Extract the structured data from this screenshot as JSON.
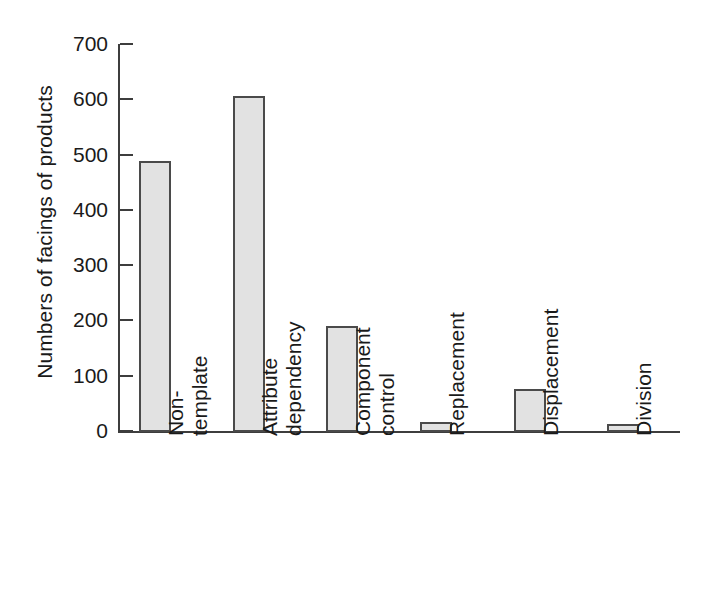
{
  "chart_data": {
    "type": "bar",
    "title": "",
    "xlabel": "",
    "ylabel": "Numbers of facings of products",
    "ylim": [
      0,
      700
    ],
    "yticks": [
      0,
      100,
      200,
      300,
      400,
      500,
      600,
      700
    ],
    "ytick_labels": [
      "0",
      "100",
      "200",
      "300",
      "400",
      "500",
      "600",
      "700"
    ],
    "grid": false,
    "legend": false,
    "bar_fill_color": "#e2e2e2",
    "bar_edge_color": "#4a4a4a",
    "axis_color": "#3d3d3d",
    "categories": [
      "Non-template",
      "Attribute dependency",
      "Component control",
      "Replacement",
      "Displacement",
      "Division"
    ],
    "category_label_lines": [
      [
        "Non-",
        "template"
      ],
      [
        "Attribute",
        "dependency"
      ],
      [
        "Component",
        "control"
      ],
      [
        "Replacement",
        ""
      ],
      [
        "Displacement",
        ""
      ],
      [
        "Division",
        ""
      ]
    ],
    "values": [
      490,
      608,
      192,
      18,
      78,
      15
    ]
  }
}
